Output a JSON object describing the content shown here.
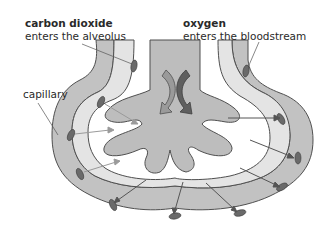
{
  "labels": {
    "co2": {
      "title": "carbon dioxide",
      "sub": "enters the alveolus"
    },
    "o2": {
      "title": "oxygen",
      "sub": "enters the bloodstream"
    },
    "capillary": "capillary"
  },
  "colors": {
    "capillary_fill": "#bdbdbd",
    "alveolus_fill": "#e6e6e6",
    "tissue_fill": "#c8c8c8",
    "outline": "#555555",
    "cell_fill": "#6a6a6a",
    "arrow_light": "#9a9a9a",
    "arrow_dark": "#5a5a5a"
  }
}
